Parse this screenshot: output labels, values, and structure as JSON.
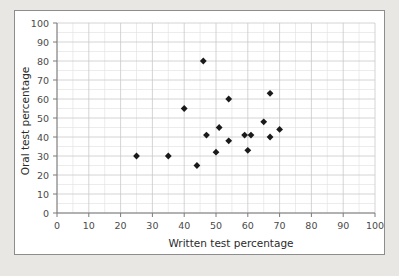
{
  "chart_data": {
    "type": "scatter",
    "title": "",
    "xlabel": "Written test percentage",
    "ylabel": "Oral test percentage",
    "xlim": [
      0,
      100
    ],
    "ylim": [
      0,
      100
    ],
    "xticks": [
      0,
      10,
      20,
      30,
      40,
      50,
      60,
      70,
      80,
      90,
      100
    ],
    "yticks": [
      0,
      10,
      20,
      30,
      40,
      50,
      60,
      70,
      80,
      90,
      100
    ],
    "xtick_labels": [
      "0",
      "10",
      "20",
      "30",
      "40",
      "50",
      "60",
      "70",
      "80",
      "90",
      "100"
    ],
    "ytick_labels": [
      "0",
      "10",
      "20",
      "30",
      "40",
      "50",
      "60",
      "70",
      "80",
      "90",
      "100"
    ],
    "grid": true,
    "grid_minor_step": 5,
    "grid_major_step": 10,
    "legend": false,
    "marker": "diamond",
    "marker_color": "#1a1a1a",
    "points": [
      {
        "x": 25,
        "y": 30
      },
      {
        "x": 35,
        "y": 30
      },
      {
        "x": 40,
        "y": 55
      },
      {
        "x": 44,
        "y": 25
      },
      {
        "x": 46,
        "y": 80
      },
      {
        "x": 47,
        "y": 41
      },
      {
        "x": 50,
        "y": 32
      },
      {
        "x": 51,
        "y": 45
      },
      {
        "x": 54,
        "y": 60
      },
      {
        "x": 54,
        "y": 38
      },
      {
        "x": 59,
        "y": 41
      },
      {
        "x": 60,
        "y": 33
      },
      {
        "x": 65,
        "y": 48
      },
      {
        "x": 67,
        "y": 63
      },
      {
        "x": 67,
        "y": 40
      },
      {
        "x": 70,
        "y": 44
      },
      {
        "x": 61,
        "y": 41
      }
    ]
  },
  "colors": {
    "page_background": "#e9e7e4",
    "panel_background": "#ffffff",
    "panel_border": "#8d8d8d",
    "axis": "#7a7a7a",
    "grid_major": "#c9c9c9",
    "grid_minor": "#e4e4e4",
    "marker": "#1a1a1a",
    "tick_text": "#4a4a4a",
    "title_text": "#2b2b2b"
  }
}
